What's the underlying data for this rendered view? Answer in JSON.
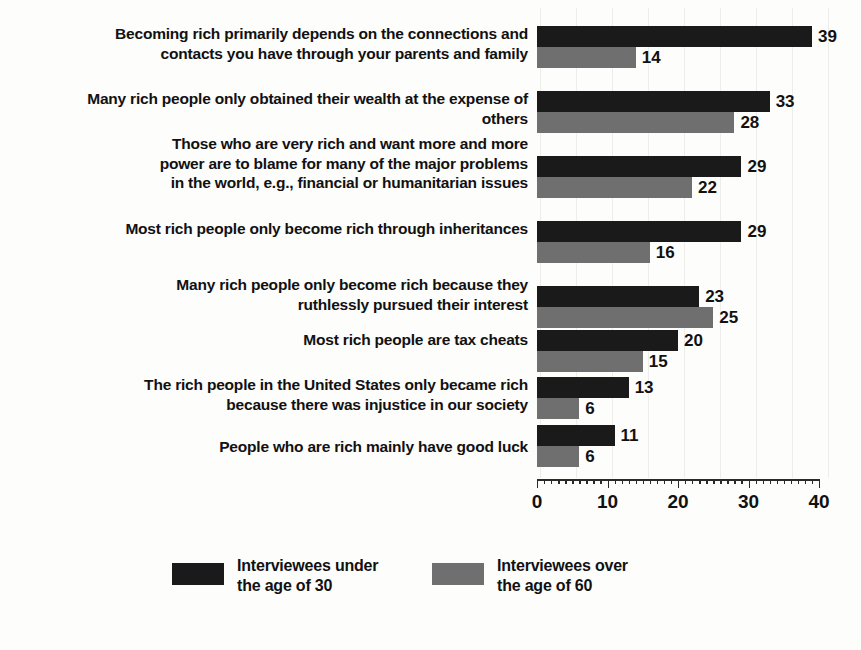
{
  "chart_data": {
    "type": "bar",
    "orientation": "horizontal",
    "title": "",
    "subtitle": "",
    "xlabel": "",
    "ylabel": "",
    "xlim": [
      0,
      40
    ],
    "xticks": [
      0,
      10,
      20,
      30,
      40
    ],
    "xtick_labels": [
      "0",
      "10",
      "20",
      "30",
      "40"
    ],
    "grid": false,
    "legend_position": "bottom",
    "categories": [
      "Becoming rich primarily depends on the connections and\ncontacts you have through your parents and family",
      "Many rich people only obtained their wealth at the expense of others",
      "Those who are very rich and want more and more\npower are to blame for many of the major problems\nin the world, e.g., financial or humanitarian issues",
      "Most rich people only become rich through inheritances",
      "Many rich people only become rich because they\nruthlessly pursued their interest",
      "Most rich people are tax cheats",
      "The rich people in the United States only became rich\nbecause there was injustice in our society",
      "People who are rich mainly have good luck"
    ],
    "series": [
      {
        "name": "Interviewees under\nthe age of 30",
        "color": "#1a1a1a",
        "values": [
          39,
          33,
          29,
          29,
          23,
          20,
          13,
          11
        ]
      },
      {
        "name": "Interviewees over\nthe age of 60",
        "color": "#6f6f6f",
        "values": [
          14,
          28,
          22,
          16,
          25,
          15,
          6,
          6
        ]
      }
    ],
    "value_labels": [
      [
        "39",
        "14"
      ],
      [
        "33",
        "28"
      ],
      [
        "29",
        "22"
      ],
      [
        "29",
        "16"
      ],
      [
        "23",
        "25"
      ],
      [
        "20",
        "15"
      ],
      [
        "13",
        "6"
      ],
      [
        "11",
        "6"
      ]
    ]
  },
  "legend": {
    "items": [
      {
        "label": "Interviewees under\nthe age of 30",
        "color": "#1a1a1a"
      },
      {
        "label": "Interviewees over\nthe age of 60",
        "color": "#6f6f6f"
      }
    ]
  }
}
